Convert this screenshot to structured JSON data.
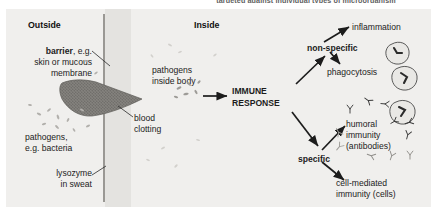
{
  "diagram": {
    "top_caption": "targeted against individual types of microorganism",
    "headers": {
      "outside": "Outside",
      "inside": "Inside"
    },
    "labels": {
      "barrier_bold": "barrier",
      "barrier_rest": ", e.g.",
      "barrier_line2": "skin or mucous",
      "barrier_line3": "membrane",
      "pathogens_outside_line1": "pathogens,",
      "pathogens_outside_line2": "e.g. bacteria",
      "lysozyme_line1": "lysozyme",
      "lysozyme_line2": "in sweat",
      "blood_clotting_line1": "blood",
      "blood_clotting_line2": "clotting",
      "pathogens_inside_line1": "pathogens",
      "pathogens_inside_line2": "inside body",
      "immune_response_line1": "IMMUNE",
      "immune_response_line2": "RESPONSE",
      "non_specific": "non-specific",
      "inflammation": "inflammation",
      "phagocytosis": "phagocytosis",
      "specific": "specific",
      "humoral_line1": "humoral",
      "humoral_line2": "immunity",
      "humoral_line3": "(antibodies)",
      "cell_mediated_line1": "cell-mediated",
      "cell_mediated_line2": "immunity (cells)"
    },
    "icons": {
      "blood_clot": "blood-clot-wedge",
      "barrier": "barrier-membrane-line",
      "pathogen_specks": "pathogen-bacteria-specks",
      "phagocyte_cells": "phagocyte-cell-blobs",
      "antibody_glyphs": "antibody-y-glyphs",
      "arrow": "arrow-icon"
    },
    "colors": {
      "panel_bg": "#f0efed",
      "tint_band": "#e4e3e0",
      "clot_fill": "#7c7a76",
      "barrier": "#9a9894",
      "text": "#1c1c1c",
      "caption": "#5e5e5e",
      "speck": "#b4b2ae"
    }
  }
}
